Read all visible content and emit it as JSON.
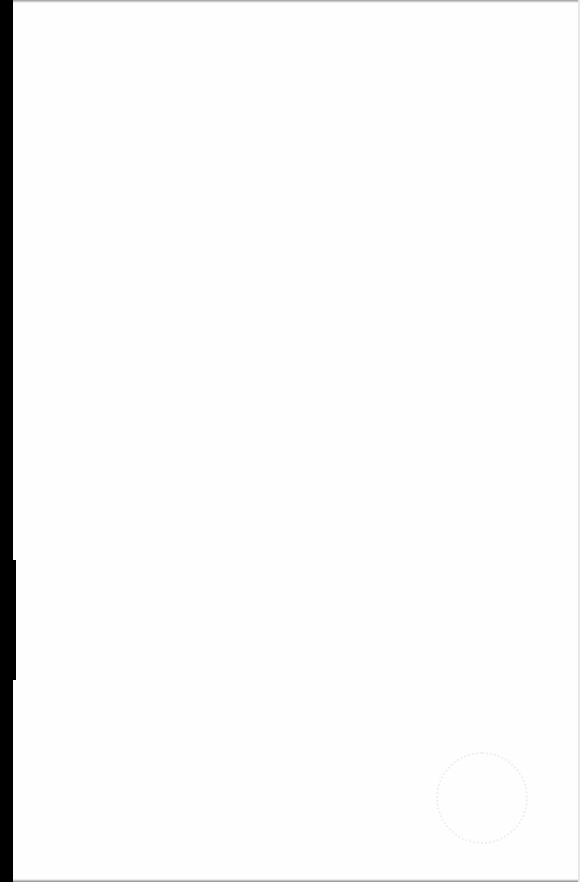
{
  "document": {
    "type": "scanned-blank-page",
    "body_text": "",
    "stamp": {
      "text": ""
    }
  },
  "colors": {
    "paper": "#fefefe",
    "binding": "#000000"
  }
}
